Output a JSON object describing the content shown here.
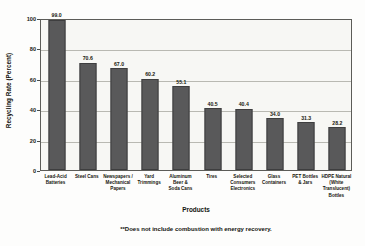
{
  "chart_data": {
    "type": "bar",
    "title": "",
    "xlabel": "Products",
    "ylabel": "Recycling Rate (Percent)",
    "ylim": [
      0,
      100
    ],
    "yticks": [
      0,
      20,
      40,
      60,
      80,
      100
    ],
    "grid": true,
    "legend": "none",
    "bar_color": "#59595a",
    "plot_background": "#f7f7f4",
    "categories": [
      "Lead-Acid Batteries",
      "Steel Cans",
      "Newspapers / Mechanical Papers",
      "Yard Trimmings",
      "Aluminum Beer & Soda Cans",
      "Tires",
      "Selected Consumers Electronics",
      "Glass Containers",
      "PET Bottles & Jars",
      "HDPE Natural (White Translucent) Bottles"
    ],
    "category_lines": [
      [
        "Lead-Acid",
        "Batteries"
      ],
      [
        "Steel Cans"
      ],
      [
        "Newspapers /",
        "Mechanical",
        "Papers"
      ],
      [
        "Yard",
        "Trimmings"
      ],
      [
        "Aluminum",
        "Beer &",
        "Soda Cans"
      ],
      [
        "Tires"
      ],
      [
        "Selected",
        "Consumers",
        "Electronics"
      ],
      [
        "Glass",
        "Containers"
      ],
      [
        "PET Bottles",
        "& Jars"
      ],
      [
        "HDPE Natural",
        "(White",
        "Translucent)",
        "Bottles"
      ]
    ],
    "values": [
      99.0,
      70.6,
      67.0,
      60.2,
      55.1,
      40.5,
      40.4,
      34.0,
      31.3,
      28.2
    ],
    "value_labels": [
      "99.0",
      "70.6",
      "67.0",
      "60.2",
      "55.1",
      "40.5",
      "40.4",
      "34.0",
      "31.3",
      "28.2"
    ],
    "annotation": "**Does not include combustion with energy recovery."
  }
}
